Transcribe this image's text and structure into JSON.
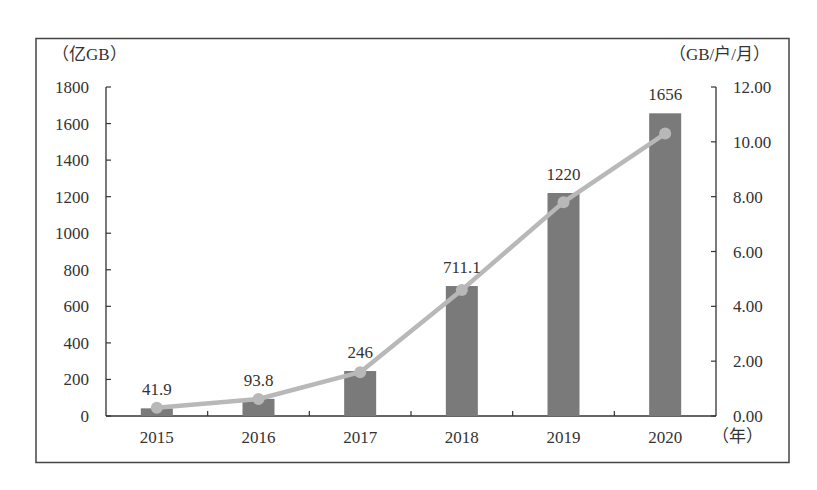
{
  "chart_data": {
    "type": "bar+line",
    "title": "",
    "categories": [
      "2015",
      "2016",
      "2017",
      "2018",
      "2019",
      "2020"
    ],
    "series": [
      {
        "name": "移动互联网接入流量",
        "type": "bar",
        "axis": "left",
        "values": [
          41.9,
          93.8,
          246,
          711.1,
          1220,
          1656
        ],
        "data_labels": [
          "41.9",
          "93.8",
          "246",
          "711.1",
          "1220",
          "1656"
        ],
        "color": "#7a7a7a"
      },
      {
        "name": "户均移动互联网接入流量",
        "type": "line",
        "axis": "right",
        "values": [
          0.3,
          0.62,
          1.6,
          4.6,
          7.8,
          10.3
        ],
        "color": "#b8b8b8"
      }
    ],
    "left_axis": {
      "unit_label": "（亿GB）",
      "min": 0,
      "max": 1800,
      "ticks": [
        "0",
        "200",
        "400",
        "600",
        "800",
        "1000",
        "1200",
        "1400",
        "1600",
        "1800"
      ]
    },
    "right_axis": {
      "unit_label": "（GB/户/月）",
      "min": 0,
      "max": 12,
      "ticks": [
        "0.00",
        "2.00",
        "4.00",
        "6.00",
        "8.00",
        "10.00",
        "12.00"
      ]
    },
    "x_axis": {
      "unit_label": "（年）"
    },
    "grid": false,
    "legend": null
  }
}
